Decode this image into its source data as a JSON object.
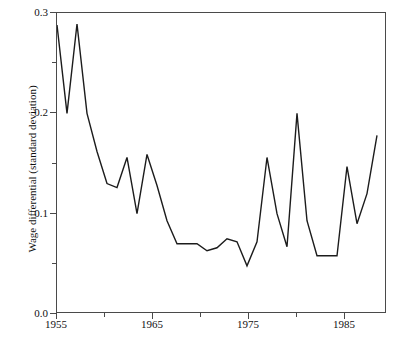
{
  "chart_data": {
    "type": "line",
    "title": "",
    "xlabel": "",
    "ylabel": "Wage differential (standard deviation)",
    "xlim": [
      1955,
      1988
    ],
    "ylim": [
      0.0,
      0.3
    ],
    "grid": false,
    "legend": null,
    "x_major_ticks": [
      1955,
      1965,
      1975,
      1985
    ],
    "x_minor_ticks": [
      1960,
      1970,
      1980
    ],
    "x_tick_labels": [
      "1955",
      "1965",
      "1975",
      "1985"
    ],
    "y_major_ticks": [
      0.0,
      0.1,
      0.2,
      0.3
    ],
    "y_minor_ticks": [
      0.05,
      0.15,
      0.25
    ],
    "y_tick_labels": [
      "0.0",
      "0.1",
      "0.2",
      "0.3"
    ],
    "line_color": "#1c1c1c",
    "axis_color": "#4a4a4a",
    "background_color": "#ffffff",
    "series": [
      {
        "name": "Wage differential",
        "x": [
          1955,
          1956,
          1957,
          1958,
          1959,
          1960,
          1961,
          1962,
          1963,
          1964,
          1965,
          1966,
          1967,
          1968,
          1969,
          1970,
          1971,
          1972,
          1973,
          1974,
          1975,
          1976,
          1977,
          1978,
          1979,
          1980,
          1981,
          1982,
          1983,
          1984,
          1985,
          1986,
          1987
        ],
        "y": [
          0.288,
          0.2,
          0.289,
          0.2,
          0.162,
          0.13,
          0.126,
          0.156,
          0.1,
          0.159,
          0.128,
          0.093,
          0.07,
          0.07,
          0.07,
          0.063,
          0.066,
          0.075,
          0.072,
          0.048,
          0.072,
          0.156,
          0.1,
          0.067,
          0.2,
          0.093,
          0.058,
          0.058,
          0.058,
          0.147,
          0.09,
          0.12,
          0.178
        ]
      }
    ]
  },
  "axis_labels": {
    "y_title": "Wage differential (standard deviation)",
    "x_ticks": [
      "1955",
      "1965",
      "1975",
      "1985"
    ],
    "y_ticks": [
      "0.0",
      "0.1",
      "0.2",
      "0.3"
    ]
  }
}
